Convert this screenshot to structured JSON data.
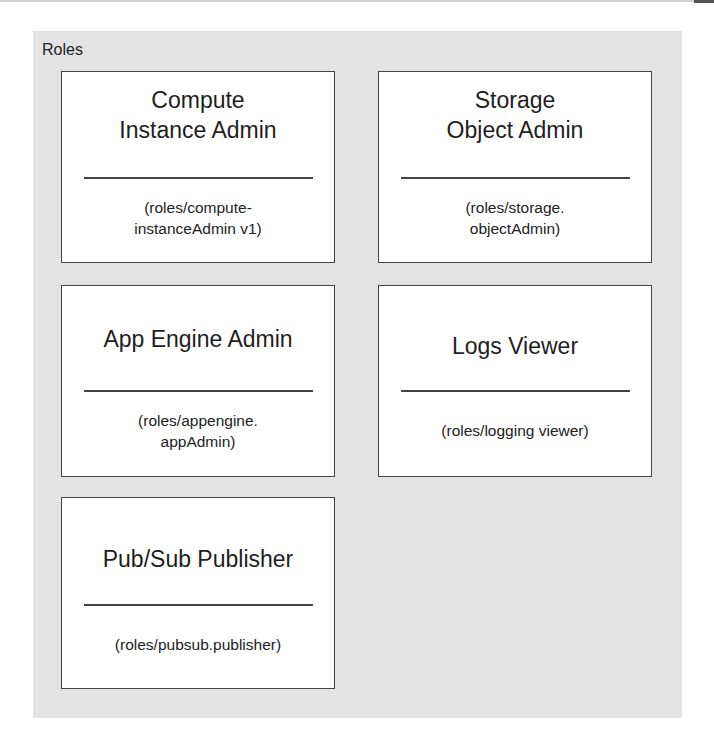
{
  "diagram": {
    "container_label": "Roles",
    "roles": [
      {
        "title_lines": [
          "Compute",
          "Instance Admin"
        ],
        "id_lines": [
          "(roles/compute-",
          "instanceAdmin v1)"
        ]
      },
      {
        "title_lines": [
          "Storage",
          "Object Admin"
        ],
        "id_lines": [
          "(roles/storage.",
          "objectAdmin)"
        ]
      },
      {
        "title_lines": [
          "App Engine Admin"
        ],
        "id_lines": [
          "(roles/appengine.",
          "appAdmin)"
        ]
      },
      {
        "title_lines": [
          "Logs Viewer"
        ],
        "id_lines": [
          "(roles/logging viewer)"
        ]
      },
      {
        "title_lines": [
          "Pub/Sub Publisher"
        ],
        "id_lines": [
          "(roles/pubsub.publisher)"
        ]
      }
    ],
    "colors": {
      "panel": "#e3e3e3",
      "box": "#ffffff",
      "border": "#444444"
    }
  }
}
